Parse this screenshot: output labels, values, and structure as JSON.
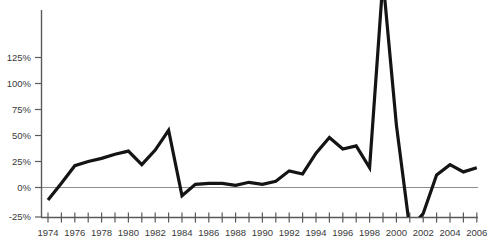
{
  "chart_data": {
    "type": "line",
    "title": "",
    "subtitle": "",
    "xlabel": "",
    "ylabel": "",
    "grid": false,
    "legend": null,
    "xlim": [
      1973.5,
      2007.0
    ],
    "ylim": [
      -25,
      140
    ],
    "y_ticks": [
      -25,
      0,
      25,
      50,
      75,
      100,
      125
    ],
    "y_tick_labels": [
      "-25%",
      "0%",
      "25%",
      "50%",
      "75%",
      "100%",
      "125%"
    ],
    "x_ticks": [
      1974,
      1975,
      1976,
      1977,
      1978,
      1979,
      1980,
      1981,
      1982,
      1983,
      1984,
      1985,
      1986,
      1987,
      1988,
      1989,
      1990,
      1991,
      1992,
      1993,
      1994,
      1995,
      1996,
      1997,
      1998,
      1999,
      2000,
      2001,
      2002,
      2003,
      2004,
      2005,
      2006
    ],
    "x_tick_labels": [
      "1974",
      "",
      "1976",
      "",
      "1978",
      "",
      "1980",
      "",
      "1982",
      "",
      "1984",
      "",
      "1986",
      "",
      "1988",
      "",
      "1990",
      "",
      "1992",
      "",
      "1994",
      "",
      "1996",
      "",
      "1998",
      "",
      "2000",
      "",
      "2002",
      "",
      "2004",
      "",
      "2006"
    ],
    "x": [
      1974,
      1975,
      1976,
      1977,
      1978,
      1979,
      1980,
      1981,
      1982,
      1983,
      1984,
      1985,
      1986,
      1987,
      1988,
      1989,
      1990,
      1991,
      1992,
      1993,
      1994,
      1995,
      1996,
      1997,
      1998,
      1999,
      2000,
      2001,
      2002,
      2003,
      2004,
      2005,
      2006
    ],
    "values": [
      -12,
      4,
      21,
      25,
      28,
      32,
      35,
      22,
      36,
      55,
      -8,
      3,
      4,
      4,
      2,
      5,
      3,
      6,
      16,
      13,
      33,
      48,
      37,
      40,
      19,
      200,
      60,
      -40,
      -25,
      12,
      22,
      15,
      19
    ],
    "series": [
      {
        "name": "series-1",
        "color": "#141414",
        "values": [
          -12,
          4,
          21,
          25,
          28,
          32,
          35,
          22,
          36,
          55,
          -8,
          3,
          4,
          4,
          2,
          5,
          3,
          6,
          16,
          13,
          33,
          48,
          37,
          40,
          19,
          200,
          60,
          -40,
          -25,
          12,
          22,
          15,
          19
        ]
      }
    ]
  },
  "axes": {
    "y_axis_color": "#5a5a5a",
    "x_axis_color": "#5a5a5a",
    "zero_line_color": "#8c8c8c",
    "line_color": "#141414",
    "background": "#ffffff"
  }
}
